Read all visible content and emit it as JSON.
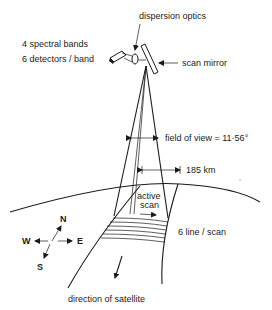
{
  "diagram": {
    "labels": {
      "dispersion_optics": "dispersion optics",
      "spectral_bands": "4 spectral bands",
      "detectors_per_band": "6 detectors / band",
      "scan_mirror": "scan mirror",
      "field_of_view": "field of view = 11·56°",
      "swath_width": "185 km",
      "active_scan_line1": "active",
      "active_scan_line2": "scan",
      "lines_per_scan": "6 line / scan",
      "direction": "direction of satellite"
    },
    "compass": {
      "north": "N",
      "south": "S",
      "east": "E",
      "west": "W"
    },
    "colors": {
      "ink": "#1a1a1a",
      "background": "#ffffff"
    }
  }
}
